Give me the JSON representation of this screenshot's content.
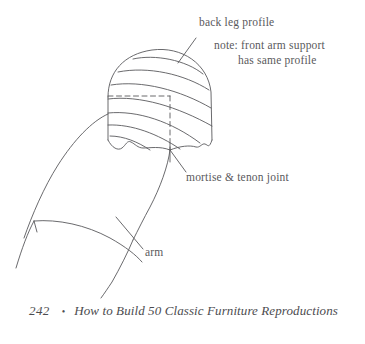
{
  "page": {
    "background_color": "#ffffff",
    "ink_color": "#59595c"
  },
  "figure": {
    "name": "back-leg-profile-and-arm-drawing",
    "labels": {
      "back_leg_profile": "back leg profile",
      "note_line_1": "note: front arm support",
      "note_line_2": "has same profile",
      "mortise_tenon": "mortise & tenon joint",
      "arm": "arm"
    }
  },
  "footer": {
    "page_number": "242",
    "separator": "•",
    "book_title": "How to Build 50 Classic Furniture Reproductions"
  }
}
